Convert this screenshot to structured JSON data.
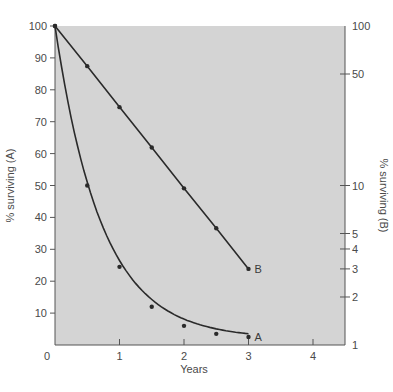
{
  "chart_data": {
    "type": "line",
    "title": "",
    "xlabel": "Years",
    "ylabel_left": "% surviving (A)",
    "ylabel_right": "% surviving (B)",
    "xlim": [
      0,
      4.5
    ],
    "ylim_left": [
      0,
      100
    ],
    "ylim_right": [
      1,
      100
    ],
    "yscale_left": "linear",
    "yscale_right": "log",
    "x_ticks": [
      {
        "value": 0,
        "label": "0"
      },
      {
        "value": 1,
        "label": "1"
      },
      {
        "value": 2,
        "label": "2"
      },
      {
        "value": 3,
        "label": "3"
      },
      {
        "value": 4,
        "label": "4"
      }
    ],
    "y_ticks_left": [
      {
        "value": 10,
        "label": "10"
      },
      {
        "value": 20,
        "label": "20"
      },
      {
        "value": 30,
        "label": "30"
      },
      {
        "value": 40,
        "label": "40"
      },
      {
        "value": 50,
        "label": "50"
      },
      {
        "value": 60,
        "label": "60"
      },
      {
        "value": 70,
        "label": "70"
      },
      {
        "value": 80,
        "label": "80"
      },
      {
        "value": 90,
        "label": "90"
      },
      {
        "value": 100,
        "label": "100"
      }
    ],
    "y_ticks_right": [
      {
        "value": 1,
        "label": "1"
      },
      {
        "value": 2,
        "label": "2"
      },
      {
        "value": 3,
        "label": "3"
      },
      {
        "value": 4,
        "label": "4"
      },
      {
        "value": 5,
        "label": "5"
      },
      {
        "value": 10,
        "label": "10"
      },
      {
        "value": 50,
        "label": "50"
      },
      {
        "value": 100,
        "label": "100"
      }
    ],
    "grid": false,
    "legend": "none",
    "series": [
      {
        "name": "A",
        "axis": "left",
        "curve": "smooth",
        "x": [
          0,
          0.5,
          1,
          1.5,
          2,
          2.5,
          3
        ],
        "values": [
          100,
          50,
          24.5,
          12,
          6,
          3.5,
          2.5
        ]
      },
      {
        "name": "B",
        "axis": "right",
        "curve": "straight",
        "x": [
          0,
          0.5,
          1,
          1.5,
          2,
          2.5,
          3
        ],
        "values": [
          100,
          56,
          31,
          17.3,
          9.6,
          5.4,
          3
        ]
      }
    ],
    "colors": {
      "plot_background": "#d4d4d4",
      "line": "#2a2a2a",
      "text": "#4a4a4a"
    }
  }
}
